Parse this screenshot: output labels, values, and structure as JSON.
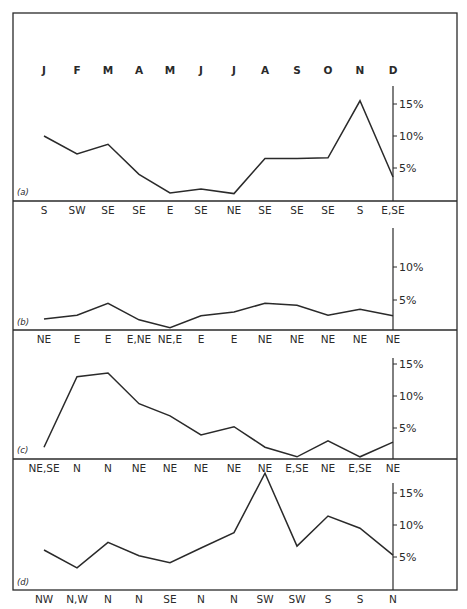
{
  "figure": {
    "month_labels": [
      "J",
      "F",
      "M",
      "A",
      "M",
      "J",
      "J",
      "A",
      "S",
      "O",
      "N",
      "D"
    ]
  },
  "chart_data": [
    {
      "type": "line",
      "panel": "(a)",
      "categories": [
        "J",
        "F",
        "M",
        "A",
        "M",
        "J",
        "J",
        "A",
        "S",
        "O",
        "N",
        "D"
      ],
      "values": [
        10.0,
        7.2,
        8.7,
        4.0,
        1.1,
        1.7,
        1.0,
        6.5,
        6.5,
        6.6,
        15.5,
        3.6
      ],
      "direction_labels": [
        "S",
        "SW",
        "SE",
        "SE",
        "E",
        "SE",
        "NE",
        "SE",
        "SE",
        "SE",
        "S",
        "E,SE"
      ],
      "yticks": [
        "5%",
        "10%",
        "15%"
      ],
      "ylim": [
        0,
        18
      ]
    },
    {
      "type": "line",
      "panel": "(b)",
      "categories": [
        "J",
        "F",
        "M",
        "A",
        "M",
        "J",
        "J",
        "A",
        "S",
        "O",
        "N",
        "D"
      ],
      "values": [
        2.1,
        2.7,
        4.5,
        2.0,
        0.8,
        2.6,
        3.2,
        4.5,
        4.2,
        2.7,
        3.6,
        2.6
      ],
      "direction_labels": [
        "NE",
        "E",
        "E",
        "E,NE",
        "NE,E",
        "E",
        "E",
        "NE",
        "NE",
        "NE",
        "NE",
        "NE"
      ],
      "yticks": [
        "5%",
        "10%"
      ],
      "ylim": [
        0,
        16
      ]
    },
    {
      "type": "line",
      "panel": "(c)",
      "categories": [
        "J",
        "F",
        "M",
        "A",
        "M",
        "J",
        "J",
        "A",
        "S",
        "O",
        "N",
        "D"
      ],
      "values": [
        2.0,
        13.0,
        13.6,
        8.8,
        6.9,
        3.9,
        5.2,
        2.0,
        0.5,
        3.0,
        0.5,
        2.8
      ],
      "direction_labels": [
        "NE,SE",
        "N",
        "N",
        "NE",
        "NE",
        "NE",
        "NE",
        "NE",
        "E,SE",
        "NE",
        "E,SE",
        "NE"
      ],
      "yticks": [
        "5%",
        "10%",
        "15%"
      ],
      "ylim": [
        0,
        16
      ]
    },
    {
      "type": "line",
      "panel": "(d)",
      "categories": [
        "J",
        "F",
        "M",
        "A",
        "M",
        "J",
        "J",
        "A",
        "S",
        "O",
        "N",
        "D"
      ],
      "values": [
        6.1,
        3.3,
        7.3,
        5.2,
        4.1,
        6.4,
        8.8,
        18.1,
        6.7,
        11.4,
        9.5,
        5.3
      ],
      "direction_labels": [
        "NW",
        "N,W",
        "N",
        "N",
        "SE",
        "N",
        "N",
        "SW",
        "SW",
        "S",
        "S",
        "N"
      ],
      "yticks": [
        "5%",
        "10%",
        "15%"
      ],
      "ylim": [
        0,
        18
      ]
    }
  ]
}
